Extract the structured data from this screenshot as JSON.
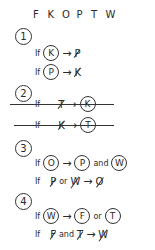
{
  "header": {
    "letters": [
      "F",
      "K",
      "O",
      "P",
      "T",
      "W"
    ]
  },
  "rules": [
    {
      "number": "1",
      "lines": [
        {
          "if": "If",
          "antecedent": "K",
          "arrow": "→",
          "consequent": "P",
          "consequent_negated": true
        },
        {
          "if": "If",
          "antecedent": "P",
          "arrow": "→",
          "consequent": "K",
          "consequent_negated": true
        }
      ]
    },
    {
      "number": "2",
      "crossed_out": true,
      "lines": [
        {
          "if": "If",
          "antecedent": "T",
          "antecedent_negated": true,
          "arrow": "→",
          "consequent": "K"
        },
        {
          "if": "If",
          "antecedent": "K",
          "antecedent_negated": true,
          "arrow": "→",
          "consequent": "T"
        }
      ]
    },
    {
      "number": "3",
      "lines": [
        {
          "if": "If",
          "antecedent": "O",
          "arrow": "→",
          "consequent": "P",
          "conjunction": "and",
          "consequent2": "W"
        },
        {
          "if": "If",
          "antecedent": "P",
          "conjunction": "or",
          "antecedent2": "W",
          "negated": true,
          "arrow": "→",
          "consequent": "O",
          "consequent_negated": true
        }
      ]
    },
    {
      "number": "4",
      "lines": [
        {
          "if": "If",
          "antecedent": "W",
          "arrow": "→",
          "consequent": "F",
          "conjunction": "or",
          "consequent2": "T"
        },
        {
          "if": "If",
          "antecedent": "F",
          "conjunction": "and",
          "antecedent2": "T",
          "negated": true,
          "arrow": "→",
          "consequent": "W",
          "consequent_negated": true
        }
      ]
    }
  ]
}
